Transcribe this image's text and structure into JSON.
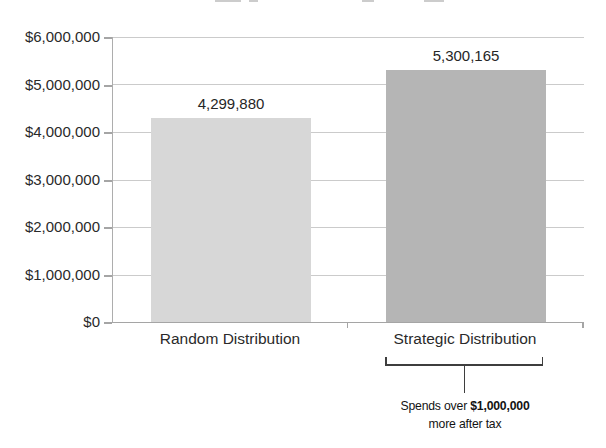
{
  "chart_data": {
    "type": "bar",
    "categories": [
      "Random Distribution",
      "Strategic Distribution"
    ],
    "values": [
      4299880,
      5300165
    ],
    "value_labels": [
      "4,299,880",
      "5,300,165"
    ],
    "title": "",
    "xlabel": "",
    "ylabel": "",
    "ylim": [
      0,
      6000000
    ],
    "grid": true,
    "y_ticks": [
      "$6,000,000",
      "$5,000,000",
      "$4,000,000",
      "$3,000,000",
      "$2,000,000",
      "$1,000,000",
      "$0"
    ],
    "y_tick_values": [
      6000000,
      5000000,
      4000000,
      3000000,
      2000000,
      1000000,
      0
    ],
    "bar_colors": [
      "#d7d7d7",
      "#b5b5b5"
    ],
    "colors": {
      "gridline": "#cbcbcb",
      "axis": "#a5a5a5",
      "text": "#2a2a2a",
      "bracket": "#3e3e3e"
    },
    "annotation": {
      "target_category": "Strategic Distribution",
      "line1_regular": "Spends over ",
      "line1_bold": "$1,000,000",
      "line2": "more after tax"
    }
  }
}
